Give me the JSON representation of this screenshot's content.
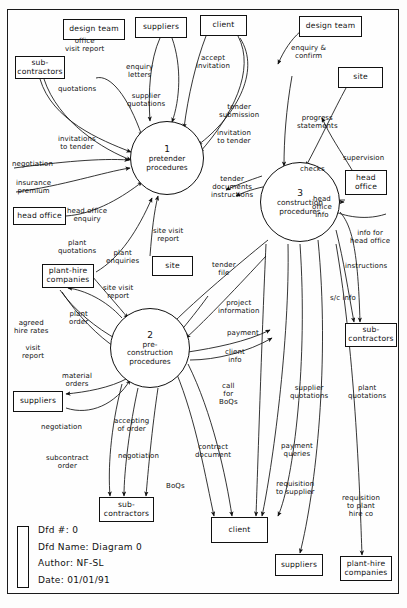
{
  "diagram": {
    "kind": "data-flow-diagram",
    "title": "Diagram 0",
    "legend": {
      "dfd_number_label": "Dfd #: 0",
      "dfd_name_label": "Dfd Name: Diagram 0",
      "author_label": "Author: NF-SL",
      "date_label": "Date: 01/01/91"
    },
    "processes": [
      {
        "id": "p1",
        "number": "1",
        "name": "pretender\nprocedures",
        "cx": 167,
        "cy": 158,
        "r": 37
      },
      {
        "id": "p2",
        "number": "2",
        "name": "pre-\nconstruction\nprocedures",
        "cx": 150,
        "cy": 348,
        "r": 40
      },
      {
        "id": "p3",
        "number": "3",
        "name": "construction\nprocedures",
        "cx": 300,
        "cy": 202,
        "r": 40
      }
    ],
    "entities": [
      {
        "id": "e-design-team-left",
        "label": "design team",
        "x": 63,
        "y": 19,
        "w": 62,
        "h": 21
      },
      {
        "id": "e-suppliers-top",
        "label": "suppliers",
        "x": 135,
        "y": 17,
        "w": 52,
        "h": 21
      },
      {
        "id": "e-client-top",
        "label": "client",
        "x": 200,
        "y": 15,
        "w": 47,
        "h": 21
      },
      {
        "id": "e-design-team-right",
        "label": "design team",
        "x": 299,
        "y": 16,
        "w": 63,
        "h": 21
      },
      {
        "id": "e-subcontractors-left",
        "label": "sub-\ncontractors",
        "x": 15,
        "y": 56,
        "w": 50,
        "h": 23
      },
      {
        "id": "e-site-right",
        "label": "site",
        "x": 338,
        "y": 67,
        "w": 45,
        "h": 21
      },
      {
        "id": "e-head-office-right",
        "label": "head\noffice",
        "x": 345,
        "y": 170,
        "w": 42,
        "h": 25
      },
      {
        "id": "e-head-office-left",
        "label": "head office",
        "x": 13,
        "y": 207,
        "w": 53,
        "h": 18
      },
      {
        "id": "e-site-mid",
        "label": "site",
        "x": 152,
        "y": 256,
        "w": 41,
        "h": 20
      },
      {
        "id": "e-plant-hire-left",
        "label": "plant-hire\ncompanies",
        "x": 42,
        "y": 264,
        "w": 52,
        "h": 24
      },
      {
        "id": "e-subcontractors-right",
        "label": "sub-\ncontractors",
        "x": 345,
        "y": 323,
        "w": 52,
        "h": 24
      },
      {
        "id": "e-suppliers-left",
        "label": "suppliers",
        "x": 13,
        "y": 391,
        "w": 50,
        "h": 21
      },
      {
        "id": "e-subcontractors-bottom",
        "label": "sub-\ncontractors",
        "x": 99,
        "y": 497,
        "w": 55,
        "h": 25
      },
      {
        "id": "e-client-bottom",
        "label": "client",
        "x": 211,
        "y": 517,
        "w": 57,
        "h": 26
      },
      {
        "id": "e-suppliers-bottom",
        "label": "suppliers",
        "x": 275,
        "y": 554,
        "w": 48,
        "h": 22
      },
      {
        "id": "e-plant-hire-bottom",
        "label": "plant-hire\ncompanies",
        "x": 340,
        "y": 556,
        "w": 52,
        "h": 25
      }
    ],
    "flows": [
      {
        "id": "f-office-visit-report",
        "label": "office\nvisit report",
        "lx": 65,
        "ly": 38
      },
      {
        "id": "f-quotations-sub",
        "label": "quotations",
        "lx": 58,
        "ly": 86
      },
      {
        "id": "f-enquiry-letters",
        "label": "enquiry\nletters",
        "lx": 126,
        "ly": 64
      },
      {
        "id": "f-supplier-quotations",
        "label": "supplier\nquotations",
        "lx": 127,
        "ly": 93
      },
      {
        "id": "f-accept-invitation",
        "label": "accept\ninvitation",
        "lx": 196,
        "ly": 55
      },
      {
        "id": "f-tender-submission",
        "label": "tender\nsubmission",
        "lx": 219,
        "ly": 104
      },
      {
        "id": "f-invitation-to-tender-client",
        "label": "invitation\nto tender",
        "lx": 217,
        "ly": 130
      },
      {
        "id": "f-enquiry-confirm",
        "label": "enquiry &\nconfirm",
        "lx": 291,
        "ly": 45
      },
      {
        "id": "f-progress-statements",
        "label": "progress\nstatements",
        "lx": 297,
        "ly": 115
      },
      {
        "id": "f-checks",
        "label": "checks",
        "lx": 300,
        "ly": 166
      },
      {
        "id": "f-supervision",
        "label": "supervision",
        "lx": 343,
        "ly": 155
      },
      {
        "id": "f-invitations-to-tender",
        "label": "invitations\nto tender",
        "lx": 58,
        "ly": 136
      },
      {
        "id": "f-negotiation-sub",
        "label": "negotiation",
        "lx": 12,
        "ly": 161
      },
      {
        "id": "f-insurance-premium",
        "label": "insurance\npremium",
        "lx": 16,
        "ly": 180
      },
      {
        "id": "f-head-office-enquiry",
        "label": "head office\nenquiry",
        "lx": 67,
        "ly": 208
      },
      {
        "id": "f-tender-documents",
        "label": "tender\ndocuments\ninstructions",
        "lx": 211,
        "ly": 176
      },
      {
        "id": "f-site-visit-report-1",
        "label": "site visit\nreport",
        "lx": 153,
        "ly": 228
      },
      {
        "id": "f-plant-quotations",
        "label": "plant\nquotations",
        "lx": 58,
        "ly": 240
      },
      {
        "id": "f-plant-enquiries",
        "label": "plant\nenquiries",
        "lx": 106,
        "ly": 250
      },
      {
        "id": "f-site-visit-report-2",
        "label": "site visit\nreport",
        "lx": 103,
        "ly": 285
      },
      {
        "id": "f-tender-file",
        "label": "tender\nfile",
        "lx": 212,
        "ly": 262
      },
      {
        "id": "f-head-office-info",
        "label": "head\noffice\ninfo",
        "lx": 312,
        "ly": 196
      },
      {
        "id": "f-info-for-head-office",
        "label": "info for\nhead office",
        "lx": 350,
        "ly": 230
      },
      {
        "id": "f-instructions-sub",
        "label": "instructions",
        "lx": 345,
        "ly": 263
      },
      {
        "id": "f-sc-info",
        "label": "s/c info",
        "lx": 330,
        "ly": 295
      },
      {
        "id": "f-plant-order",
        "label": "plant\norder",
        "lx": 69,
        "ly": 311
      },
      {
        "id": "f-agreed-hire-rates",
        "label": "agreed\nhire rates",
        "lx": 14,
        "ly": 320
      },
      {
        "id": "f-visit-report",
        "label": "visit\nreport",
        "lx": 22,
        "ly": 345
      },
      {
        "id": "f-project-information",
        "label": "project\ninformation",
        "lx": 218,
        "ly": 300
      },
      {
        "id": "f-payment",
        "label": "payment",
        "lx": 227,
        "ly": 330
      },
      {
        "id": "f-client-info",
        "label": "client\ninfo",
        "lx": 225,
        "ly": 349
      },
      {
        "id": "f-material-orders",
        "label": "material\norders",
        "lx": 62,
        "ly": 373
      },
      {
        "id": "f-negotiation-suppliers",
        "label": "negotiation",
        "lx": 41,
        "ly": 424
      },
      {
        "id": "f-call-for-boqs",
        "label": "call\nfor\nBoQs",
        "lx": 219,
        "ly": 383
      },
      {
        "id": "f-supplier-quotations-2",
        "label": "supplier\nquotations",
        "lx": 290,
        "ly": 385
      },
      {
        "id": "f-plant-quotations-2",
        "label": "plant\nquotations",
        "lx": 348,
        "ly": 385
      },
      {
        "id": "f-accepting-of-order",
        "label": "accepting\nof order",
        "lx": 114,
        "ly": 418
      },
      {
        "id": "f-negotiation-sub-2",
        "label": "negotiation",
        "lx": 118,
        "ly": 453
      },
      {
        "id": "f-subcontract-order",
        "label": "subcontract\norder",
        "lx": 46,
        "ly": 455
      },
      {
        "id": "f-contract-document",
        "label": "contract\ndocument",
        "lx": 195,
        "ly": 444
      },
      {
        "id": "f-payment-queries",
        "label": "payment\nqueries",
        "lx": 281,
        "ly": 443
      },
      {
        "id": "f-boqs",
        "label": "BoQs",
        "lx": 166,
        "ly": 483
      },
      {
        "id": "f-requisition-to-supplier",
        "label": "requisition\nto supplier",
        "lx": 276,
        "ly": 481
      },
      {
        "id": "f-requisition-to-plant",
        "label": "requisition\nto plant\nhire co",
        "lx": 342,
        "ly": 495
      }
    ]
  }
}
